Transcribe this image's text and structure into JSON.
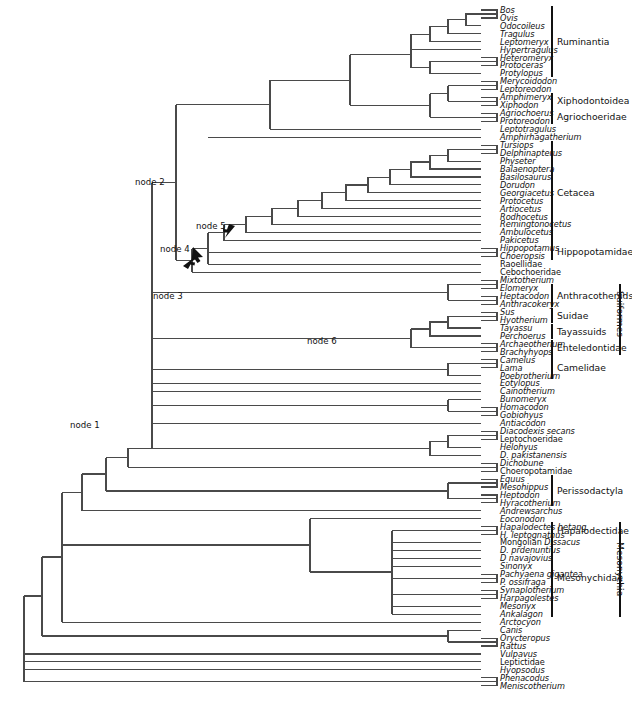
{
  "figure": {
    "type": "phylogenetic-cladogram",
    "title": "",
    "width": 632,
    "height": 710,
    "line_color": "#404040",
    "text_color": "#111111",
    "bracket_color": "#111111"
  },
  "taxa": [
    {
      "name": "Bos",
      "style": "italic",
      "row": 0
    },
    {
      "name": "Ovis",
      "style": "italic",
      "row": 1
    },
    {
      "name": "Odocoileus",
      "style": "italic",
      "row": 2
    },
    {
      "name": "Tragulus",
      "style": "italic",
      "row": 3
    },
    {
      "name": "Leptomeryx",
      "style": "italic",
      "row": 4
    },
    {
      "name": "Hypertragulus",
      "style": "italic",
      "row": 5
    },
    {
      "name": "Heteromeryx",
      "style": "italic",
      "row": 6
    },
    {
      "name": "Protoceras",
      "style": "italic",
      "row": 7
    },
    {
      "name": "Protylopus",
      "style": "italic",
      "row": 8
    },
    {
      "name": "Merycoidodon",
      "style": "italic",
      "row": 9
    },
    {
      "name": "Leptoreodon",
      "style": "italic",
      "row": 10
    },
    {
      "name": "Amphimeryx",
      "style": "italic",
      "row": 11
    },
    {
      "name": "Xiphodon",
      "style": "italic",
      "row": 12
    },
    {
      "name": "Agriochoerus",
      "style": "italic",
      "row": 13
    },
    {
      "name": "Protoreodon",
      "style": "italic",
      "row": 14
    },
    {
      "name": "Leptotragulus",
      "style": "italic",
      "row": 15
    },
    {
      "name": "Amphirhagatherium",
      "style": "italic",
      "row": 16
    },
    {
      "name": "Tursiops",
      "style": "italic",
      "row": 17
    },
    {
      "name": "Delphinapterus",
      "style": "italic",
      "row": 18
    },
    {
      "name": "Physeter",
      "style": "italic",
      "row": 19
    },
    {
      "name": "Balaenoptera",
      "style": "italic",
      "row": 20
    },
    {
      "name": "Basilosaurus",
      "style": "italic",
      "row": 21
    },
    {
      "name": "Dorudon",
      "style": "italic",
      "row": 22
    },
    {
      "name": "Georgiacetus",
      "style": "italic",
      "row": 23
    },
    {
      "name": "Protocetus",
      "style": "italic",
      "row": 24
    },
    {
      "name": "Artiocetus",
      "style": "italic",
      "row": 25
    },
    {
      "name": "Rodhocetus",
      "style": "italic",
      "row": 26
    },
    {
      "name": "Remingtonocetus",
      "style": "italic",
      "row": 27
    },
    {
      "name": "Ambulocetus",
      "style": "italic",
      "row": 28
    },
    {
      "name": "Pakicetus",
      "style": "italic",
      "row": 29
    },
    {
      "name": "Hippopotamus",
      "style": "italic",
      "row": 30
    },
    {
      "name": "Choeropsis",
      "style": "italic",
      "row": 31
    },
    {
      "name": "Raoellidae",
      "style": "roman",
      "row": 32
    },
    {
      "name": "Cebochoeridae",
      "style": "roman",
      "row": 33
    },
    {
      "name": "Mixtotherium",
      "style": "italic",
      "row": 34
    },
    {
      "name": "Elomeryx",
      "style": "italic",
      "row": 35
    },
    {
      "name": "Heptacodon",
      "style": "italic",
      "row": 36
    },
    {
      "name": "Anthracokeryx",
      "style": "italic",
      "row": 37
    },
    {
      "name": "Sus",
      "style": "italic",
      "row": 38
    },
    {
      "name": "Hyotherium",
      "style": "italic",
      "row": 39
    },
    {
      "name": "Tayassu",
      "style": "italic",
      "row": 40
    },
    {
      "name": "Perchoerus",
      "style": "italic",
      "row": 41
    },
    {
      "name": "Archaeotherium",
      "style": "italic",
      "row": 42
    },
    {
      "name": "Brachyhyops",
      "style": "italic",
      "row": 43
    },
    {
      "name": "Camelus",
      "style": "italic",
      "row": 44
    },
    {
      "name": "Lama",
      "style": "italic",
      "row": 45
    },
    {
      "name": "Poebrotherium",
      "style": "italic",
      "row": 46
    },
    {
      "name": "Eotylopus",
      "style": "italic",
      "row": 47
    },
    {
      "name": "Cainotherium",
      "style": "italic",
      "row": 48
    },
    {
      "name": "Bunomeryx",
      "style": "italic",
      "row": 49
    },
    {
      "name": "Homacodon",
      "style": "italic",
      "row": 50
    },
    {
      "name": "Gobiohyus",
      "style": "italic",
      "row": 51
    },
    {
      "name": "Antiacodon",
      "style": "italic",
      "row": 52
    },
    {
      "name": "Diacodexis secans",
      "style": "italic",
      "row": 53
    },
    {
      "name": "Leptochoeridae",
      "style": "roman",
      "row": 54
    },
    {
      "name": "Helohyus",
      "style": "italic",
      "row": 55
    },
    {
      "name": "D. pakistanensis",
      "style": "italic",
      "row": 56
    },
    {
      "name": "Dichobune",
      "style": "italic",
      "row": 57
    },
    {
      "name": "Choeropotamidae",
      "style": "roman",
      "row": 58
    },
    {
      "name": "Equus",
      "style": "italic",
      "row": 59
    },
    {
      "name": "Mesohippus",
      "style": "italic",
      "row": 60
    },
    {
      "name": "Heptodon",
      "style": "italic",
      "row": 61
    },
    {
      "name": "Hyracotherium",
      "style": "italic",
      "row": 62
    },
    {
      "name": "Andrewsarchus",
      "style": "italic",
      "row": 63
    },
    {
      "name": "Eoconodon",
      "style": "italic",
      "row": 64
    },
    {
      "name": "Hapalodectes hetang.",
      "style": "italic",
      "row": 65
    },
    {
      "name": "H. leptognathus",
      "style": "italic",
      "row": 66
    },
    {
      "name": "Mongolian Dissacus",
      "style": "mixed",
      "roman_part": "Mongolian ",
      "italic_part": "Dissacus",
      "row": 67
    },
    {
      "name": "D. prdenuntius",
      "style": "italic",
      "row": 68
    },
    {
      "name": "D navajovius",
      "style": "italic",
      "row": 69
    },
    {
      "name": "Sinonyx",
      "style": "italic",
      "row": 70
    },
    {
      "name": "Pachyaena gigantea",
      "style": "italic",
      "row": 71
    },
    {
      "name": "P. ossifraga",
      "style": "italic",
      "row": 72
    },
    {
      "name": "Synaplotherium",
      "style": "italic",
      "row": 73
    },
    {
      "name": "Harpagolestes",
      "style": "italic",
      "row": 74
    },
    {
      "name": "Mesonyx",
      "style": "italic",
      "row": 75
    },
    {
      "name": "Ankalagon",
      "style": "italic",
      "row": 76
    },
    {
      "name": "Arctocyon",
      "style": "italic",
      "row": 77
    },
    {
      "name": "Canis",
      "style": "italic",
      "row": 78
    },
    {
      "name": "Orycteropus",
      "style": "italic",
      "row": 79
    },
    {
      "name": "Rattus",
      "style": "italic",
      "row": 80
    },
    {
      "name": "Vulpavus",
      "style": "italic",
      "row": 81
    },
    {
      "name": "Leptictidae",
      "style": "roman",
      "row": 82
    },
    {
      "name": "Hyopsodus",
      "style": "italic",
      "row": 83
    },
    {
      "name": "Phenacodus",
      "style": "italic",
      "row": 84
    },
    {
      "name": "Meniscotherium",
      "style": "italic",
      "row": 85
    }
  ],
  "clades": [
    {
      "label": "Ruminantia",
      "first_row": 0,
      "last_row": 8,
      "column": 1,
      "orientation": "horizontal"
    },
    {
      "label": "Xiphodontoidea",
      "first_row": 11,
      "last_row": 12,
      "column": 1,
      "orientation": "horizontal"
    },
    {
      "label": "Agriochoeridae",
      "first_row": 13,
      "last_row": 14,
      "column": 1,
      "orientation": "horizontal"
    },
    {
      "label": "Cetacea",
      "first_row": 17,
      "last_row": 29,
      "column": 1,
      "orientation": "horizontal"
    },
    {
      "label": "Hippopotamidae",
      "first_row": 30,
      "last_row": 31,
      "column": 1,
      "orientation": "horizontal"
    },
    {
      "label": "Anthracotheriids",
      "first_row": 35,
      "last_row": 37,
      "column": 1,
      "orientation": "horizontal"
    },
    {
      "label": "Suidae",
      "first_row": 38,
      "last_row": 39,
      "column": 1,
      "orientation": "horizontal"
    },
    {
      "label": "Tayassuids",
      "first_row": 40,
      "last_row": 41,
      "column": 1,
      "orientation": "horizontal"
    },
    {
      "label": "Enteledontidae",
      "first_row": 42,
      "last_row": 43,
      "column": 1,
      "orientation": "horizontal"
    },
    {
      "label": "Camelidae",
      "first_row": 44,
      "last_row": 46,
      "column": 1,
      "orientation": "horizontal"
    },
    {
      "label": "Perissodactyla",
      "first_row": 59,
      "last_row": 62,
      "column": 1,
      "orientation": "horizontal"
    },
    {
      "label": "Hapalodectidae",
      "first_row": 65,
      "last_row": 66,
      "column": 1,
      "orientation": "horizontal"
    },
    {
      "label": "Mesonychidae",
      "first_row": 67,
      "last_row": 76,
      "column": 1,
      "orientation": "horizontal"
    },
    {
      "label": "Suiformes",
      "first_row": 35,
      "last_row": 43,
      "column": 2,
      "orientation": "vertical"
    },
    {
      "label": "Mesonychia",
      "first_row": 65,
      "last_row": 76,
      "column": 2,
      "orientation": "vertical"
    }
  ],
  "nodes": [
    {
      "label": "node 1",
      "x": 70,
      "y": 421,
      "has_arrow": false
    },
    {
      "label": "node 2",
      "x": 135,
      "y": 178,
      "has_arrow": false
    },
    {
      "label": "node 3",
      "x": 153,
      "y": 292,
      "has_arrow": true
    },
    {
      "label": "node 4",
      "x": 160,
      "y": 245,
      "has_arrow": true
    },
    {
      "label": "node 5",
      "x": 196,
      "y": 222,
      "has_arrow": true
    },
    {
      "label": "node 6",
      "x": 307,
      "y": 337,
      "has_arrow": false
    }
  ],
  "chart_data": {
    "type": "tree",
    "taxon_count": 86,
    "layout": "rectangular-cladogram",
    "root_side": "left",
    "tip_side": "right"
  }
}
